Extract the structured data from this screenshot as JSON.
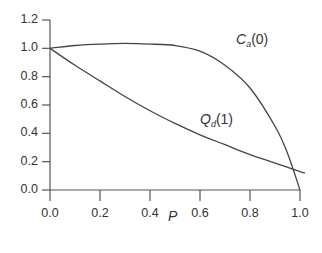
{
  "chart_data": {
    "type": "line",
    "title": "",
    "xlabel": "P",
    "ylabel": "",
    "xlim": [
      0.0,
      1.0
    ],
    "ylim": [
      0.0,
      1.2
    ],
    "grid": false,
    "legend": "inline labels",
    "x_ticks": [
      "0.0",
      "0.2",
      "0.4",
      "0.6",
      "0.8",
      "1.0"
    ],
    "y_ticks": [
      "0.0",
      "0.2",
      "0.4",
      "0.6",
      "0.8",
      "1.0",
      "1.2"
    ],
    "series": [
      {
        "name": "C_a(0)",
        "label_symbol": "C",
        "label_sub": "a",
        "label_arg": "(0)",
        "x": [
          0.0,
          0.1,
          0.2,
          0.3,
          0.4,
          0.5,
          0.6,
          0.7,
          0.8,
          0.9,
          0.95,
          1.0
        ],
        "y": [
          1.0,
          1.02,
          1.03,
          1.035,
          1.03,
          1.02,
          0.98,
          0.88,
          0.72,
          0.45,
          0.26,
          0.0
        ]
      },
      {
        "name": "Q_d(1)",
        "label_symbol": "Q",
        "label_sub": "d",
        "label_arg": "(1)",
        "x": [
          0.0,
          0.1,
          0.2,
          0.3,
          0.4,
          0.5,
          0.6,
          0.7,
          0.8,
          0.9,
          1.0
        ],
        "y": [
          1.0,
          0.88,
          0.77,
          0.66,
          0.56,
          0.47,
          0.39,
          0.32,
          0.25,
          0.19,
          0.13
        ]
      }
    ]
  },
  "labels": {
    "xaxis_title": "P",
    "ca_symbol": "C",
    "ca_sub": "a",
    "ca_arg": "(0)",
    "qd_symbol": "Q",
    "qd_sub": "d",
    "qd_arg": "(1)",
    "yticks": [
      "1.2",
      "1.0",
      "0.8",
      "0.6",
      "0.4",
      "0.2",
      "0.0"
    ],
    "xticks": [
      "0.0",
      "0.2",
      "0.4",
      "0.6",
      "0.8",
      "1.0"
    ]
  }
}
